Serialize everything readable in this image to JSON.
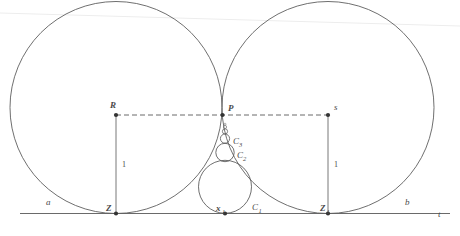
{
  "figure": {
    "background_color": "#ffffff",
    "stroke_color": "#5a5a5a",
    "label_color": "#4a4a4a"
  },
  "labels": {
    "line_t": "t",
    "circle_a": "a",
    "circle_b": "b",
    "point_R": "R",
    "point_P": "P",
    "point_s": "s",
    "point_Z": "Z",
    "point_Z1_base": "Z",
    "point_Z1_sub": "1",
    "point_x1_base": "x",
    "point_x1_sub": "1",
    "circle_C1_base": "C",
    "circle_C1_sub": "1",
    "circle_C2_base": "C",
    "circle_C2_sub": "2",
    "circle_C3_base": "C",
    "circle_C3_sub": "3",
    "length_left": "1",
    "length_right": "1"
  },
  "geometry": {
    "baseline_y": 213,
    "baseline_x_start": 20,
    "baseline_x_end": 450,
    "left_circle": {
      "cx": 116,
      "cy": 115,
      "r": 106
    },
    "right_circle": {
      "cx": 328,
      "cy": 115,
      "r": 106
    },
    "tangency_point_P": {
      "x": 222,
      "y": 115
    },
    "point_Z": {
      "x": 116,
      "y": 213
    },
    "point_Z1": {
      "x": 328,
      "y": 213
    },
    "dashed_line": {
      "x1": 116,
      "x2": 328,
      "y": 115
    },
    "chain": [
      {
        "name": "C1",
        "cx": 225,
        "cy": 186.5,
        "r": 26.5
      },
      {
        "name": "C2",
        "cx": 225,
        "cy": 152,
        "r": 9.0
      },
      {
        "name": "C3",
        "cx": 225,
        "cy": 138.5,
        "r": 4.5
      },
      {
        "name": "C4",
        "cx": 225,
        "cy": 131.5,
        "r": 2.6
      },
      {
        "name": "C5",
        "cx": 225,
        "cy": 127.2,
        "r": 1.7
      }
    ],
    "vertical_left": {
      "x": 116,
      "y1": 115,
      "y2": 213
    },
    "vertical_right": {
      "x": 328,
      "y1": 115,
      "y2": 213
    }
  }
}
